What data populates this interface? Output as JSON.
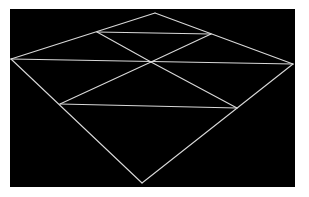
{
  "figure": {
    "background_color": "#000000",
    "line_color": "#d8d8d8",
    "panel": {
      "x": 10,
      "y": 9,
      "width": 285,
      "height": 178
    },
    "vertices": {
      "top": [
        155,
        13
      ],
      "left": [
        11,
        59
      ],
      "right": [
        293,
        64
      ],
      "bottom": [
        142,
        183
      ],
      "upper_left_mid": [
        97,
        32
      ],
      "upper_right_mid": [
        211,
        34
      ],
      "lower_left_mid": [
        60,
        104
      ],
      "lower_right_mid": [
        237,
        108
      ],
      "center": [
        151,
        62
      ]
    },
    "edges": [
      [
        "top",
        "left"
      ],
      [
        "top",
        "right"
      ],
      [
        "left",
        "bottom"
      ],
      [
        "right",
        "bottom"
      ],
      [
        "upper_left_mid",
        "upper_right_mid"
      ],
      [
        "left",
        "right"
      ],
      [
        "lower_left_mid",
        "lower_right_mid"
      ],
      [
        "upper_left_mid",
        "center"
      ],
      [
        "center",
        "lower_right_mid"
      ],
      [
        "upper_right_mid",
        "center"
      ],
      [
        "center",
        "lower_left_mid"
      ]
    ]
  }
}
